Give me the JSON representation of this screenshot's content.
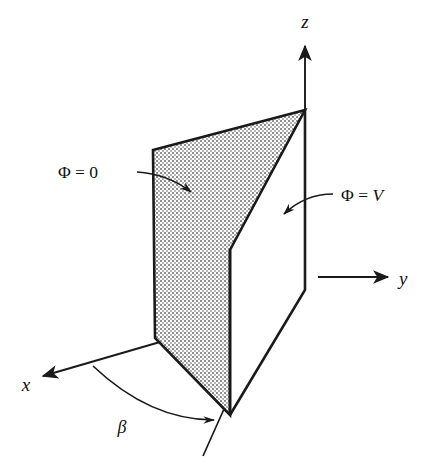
{
  "figure": {
    "kind": "3d-wedge-geometry-diagram",
    "background_color": "#ffffff",
    "ink_color": "#1a1a1a",
    "shading_color": "#9a9a9a"
  },
  "axes": [
    {
      "id": "z",
      "label": "z",
      "direction": "up",
      "label_x": 305,
      "label_y": 28
    },
    {
      "id": "y",
      "label": "y",
      "direction": "right",
      "label_x": 400,
      "label_y": 288
    },
    {
      "id": "x",
      "label": "x",
      "direction": "down-left",
      "label_x": 20,
      "label_y": 389
    }
  ],
  "annotations": {
    "zero_plane": {
      "name": "phi-equals-zero",
      "symbol": "Φ",
      "relation": "=",
      "value": "0",
      "text": "Φ = 0",
      "label_x": 78,
      "label_y": 177,
      "leader_from": [
        138,
        172
      ],
      "leader_to": [
        196,
        196
      ]
    },
    "v_plane": {
      "name": "phi-equals-v",
      "symbol": "Φ",
      "relation": "=",
      "value": "V",
      "text": "Φ = V",
      "label_x": 340,
      "label_y": 203,
      "leader_from": [
        333,
        195
      ],
      "leader_to": [
        278,
        218
      ]
    },
    "wedge_angle": {
      "name": "beta-angle",
      "symbol": "β",
      "text": "β",
      "label_x": 122,
      "label_y": 432
    }
  },
  "geometry": {
    "apex": [
      305,
      110
    ],
    "shaded_plane_vertices": [
      [
        153,
        150
      ],
      [
        305,
        110
      ],
      [
        230,
        250
      ],
      [
        230,
        415
      ],
      [
        155,
        338
      ]
    ],
    "v_plane_vertices": [
      [
        305,
        110
      ],
      [
        305,
        290
      ],
      [
        230,
        415
      ],
      [
        230,
        250
      ]
    ],
    "fold_edge": [
      [
        230,
        250
      ],
      [
        230,
        415
      ]
    ],
    "z_axis": [
      [
        305,
        110
      ],
      [
        305,
        40
      ]
    ],
    "y_axis": [
      [
        318,
        277
      ],
      [
        392,
        277
      ]
    ],
    "x_axis": [
      [
        160,
        342
      ],
      [
        38,
        378
      ]
    ],
    "beta_arc_start": [
      93,
      366
    ],
    "beta_arc_end": [
      219,
      422
    ],
    "trace_tick": [
      [
        202,
        455
      ],
      [
        222,
        410
      ]
    ]
  }
}
